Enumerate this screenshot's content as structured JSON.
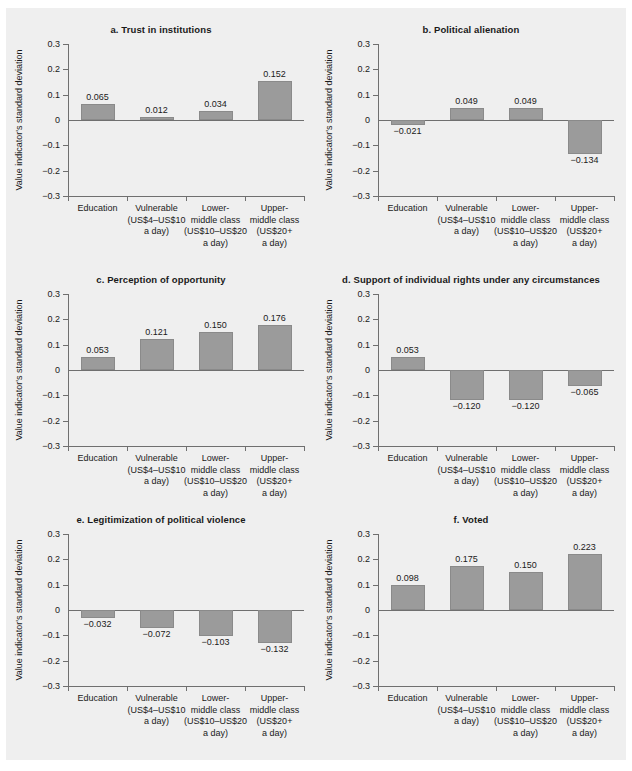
{
  "figure": {
    "background": "#efefef",
    "bar_color": "#9b9b9b",
    "axis_color": "#6f6f6f",
    "text_color": "#1a1a1a"
  },
  "axis": {
    "ylabel": "Value indicator's standard deviation",
    "yticks": [
      "0.3",
      "0.2",
      "0.1",
      "0",
      "−0.1",
      "−0.2",
      "−0.3"
    ],
    "ytick_values": [
      0.3,
      0.2,
      0.1,
      0,
      -0.1,
      -0.2,
      -0.3
    ],
    "ylim": [
      -0.3,
      0.3
    ]
  },
  "categories": [
    {
      "lines": [
        "Education"
      ]
    },
    {
      "lines": [
        "Vulnerable",
        "(US$4–US$10",
        "a day)"
      ]
    },
    {
      "lines": [
        "Lower-",
        "middle class",
        "(US$10–US$20",
        "a day)"
      ]
    },
    {
      "lines": [
        "Upper-",
        "middle class",
        "(US$20+",
        "a day)"
      ]
    }
  ],
  "chart_data": [
    {
      "type": "bar",
      "panel": "a",
      "title": "a.  Trust in institutions",
      "categories": [
        "Education",
        "Vulnerable (US$4–US$10 a day)",
        "Lower-middle class (US$10–US$20 a day)",
        "Upper-middle class (US$20+ a day)"
      ],
      "values": [
        0.065,
        0.012,
        0.034,
        0.152
      ],
      "labels": [
        "0.065",
        "0.012",
        "0.034",
        "0.152"
      ],
      "xlabel": "",
      "ylabel": "Value indicator's standard deviation",
      "ylim": [
        -0.3,
        0.3
      ],
      "grid": false,
      "legend": false
    },
    {
      "type": "bar",
      "panel": "b",
      "title": "b.  Political alienation",
      "categories": [
        "Education",
        "Vulnerable (US$4–US$10 a day)",
        "Lower-middle class (US$10–US$20 a day)",
        "Upper-middle class (US$20+ a day)"
      ],
      "values": [
        -0.021,
        0.049,
        0.049,
        -0.134
      ],
      "labels": [
        "−0.021",
        "0.049",
        "0.049",
        "−0.134"
      ],
      "xlabel": "",
      "ylabel": "Value indicator's standard deviation",
      "ylim": [
        -0.3,
        0.3
      ],
      "grid": false,
      "legend": false
    },
    {
      "type": "bar",
      "panel": "c",
      "title": "c.  Perception of opportunity",
      "categories": [
        "Education",
        "Vulnerable (US$4–US$10 a day)",
        "Lower-middle class (US$10–US$20 a day)",
        "Upper-middle class (US$20+ a day)"
      ],
      "values": [
        0.053,
        0.121,
        0.15,
        0.176
      ],
      "labels": [
        "0.053",
        "0.121",
        "0.150",
        "0.176"
      ],
      "xlabel": "",
      "ylabel": "Value indicator's standard deviation",
      "ylim": [
        -0.3,
        0.3
      ],
      "grid": false,
      "legend": false
    },
    {
      "type": "bar",
      "panel": "d",
      "title": "d.  Support of individual rights under any circumstances",
      "categories": [
        "Education",
        "Vulnerable (US$4–US$10 a day)",
        "Lower-middle class (US$10–US$20 a day)",
        "Upper-middle class (US$20+ a day)"
      ],
      "values": [
        0.053,
        -0.12,
        -0.12,
        -0.065
      ],
      "labels": [
        "0.053",
        "−0.120",
        "−0.120",
        "−0.065"
      ],
      "xlabel": "",
      "ylabel": "Value indicator's standard deviation",
      "ylim": [
        -0.3,
        0.3
      ],
      "grid": false,
      "legend": false
    },
    {
      "type": "bar",
      "panel": "e",
      "title": "e.  Legitimization of political violence",
      "categories": [
        "Education",
        "Vulnerable (US$4–US$10 a day)",
        "Lower-middle class (US$10–US$20 a day)",
        "Upper-middle class (US$20+ a day)"
      ],
      "values": [
        -0.032,
        -0.072,
        -0.103,
        -0.132
      ],
      "labels": [
        "−0.032",
        "−0.072",
        "−0.103",
        "−0.132"
      ],
      "xlabel": "",
      "ylabel": "Value indicator's standard deviation",
      "ylim": [
        -0.3,
        0.3
      ],
      "grid": false,
      "legend": false
    },
    {
      "type": "bar",
      "panel": "f",
      "title": "f.  Voted",
      "categories": [
        "Education",
        "Vulnerable (US$4–US$10 a day)",
        "Lower-middle class (US$10–US$20 a day)",
        "Upper-middle class (US$20+ a day)"
      ],
      "values": [
        0.098,
        0.175,
        0.15,
        0.223
      ],
      "labels": [
        "0.098",
        "0.175",
        "0.150",
        "0.223"
      ],
      "xlabel": "",
      "ylabel": "Value indicator's standard deviation",
      "ylim": [
        -0.3,
        0.3
      ],
      "grid": false,
      "legend": false
    }
  ]
}
